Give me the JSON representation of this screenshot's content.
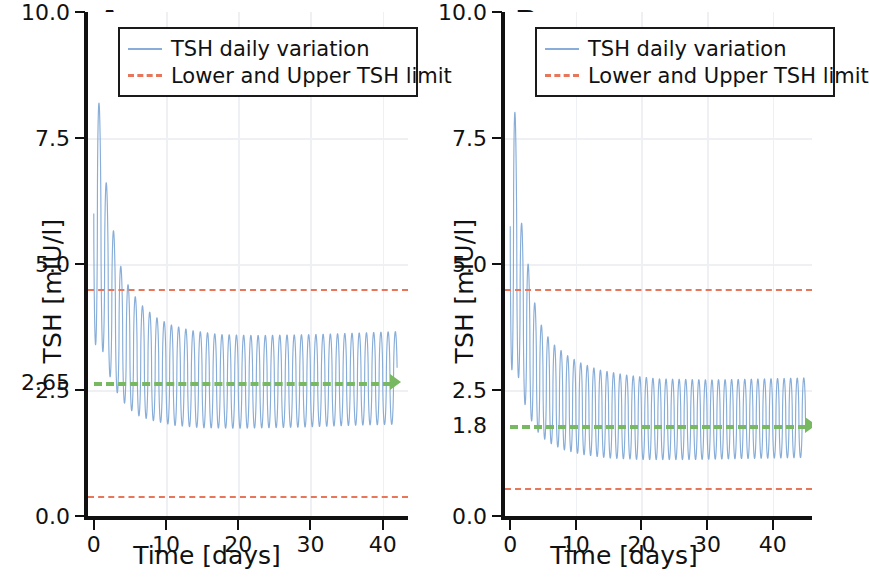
{
  "figure": {
    "panels": [
      {
        "letter": "A",
        "ylabel": "TSH [mIU/l]",
        "xlabel": "Time [days]",
        "yticks": [
          {
            "value": 10.0,
            "label": "10.0"
          },
          {
            "value": 7.5,
            "label": "7.5"
          },
          {
            "value": 5.0,
            "label": "5.0"
          },
          {
            "value": 2.65,
            "label": "2.65"
          },
          {
            "value": 2.5,
            "label": "2.5"
          },
          {
            "value": 0.0,
            "label": "0.0"
          }
        ],
        "xticks": [
          {
            "value": 0,
            "label": "0"
          },
          {
            "value": 10,
            "label": "10"
          },
          {
            "value": 20,
            "label": "20"
          },
          {
            "value": 30,
            "label": "30"
          },
          {
            "value": 40,
            "label": "40"
          }
        ],
        "target_value": 2.65,
        "target_label": "2.65"
      },
      {
        "letter": "B",
        "ylabel": "TSH [mIU/l]",
        "xlabel": "Time [days]",
        "yticks": [
          {
            "value": 10.0,
            "label": "10.0"
          },
          {
            "value": 7.5,
            "label": "7.5"
          },
          {
            "value": 5.0,
            "label": "5.0"
          },
          {
            "value": 2.5,
            "label": "2.5"
          },
          {
            "value": 1.8,
            "label": "1.8"
          },
          {
            "value": 0.0,
            "label": "0.0"
          }
        ],
        "xticks": [
          {
            "value": 0,
            "label": "0"
          },
          {
            "value": 10,
            "label": "10"
          },
          {
            "value": 20,
            "label": "20"
          },
          {
            "value": 30,
            "label": "30"
          },
          {
            "value": 40,
            "label": "40"
          }
        ],
        "target_value": 1.8,
        "target_label": "1.8"
      }
    ],
    "legend": {
      "entries": [
        {
          "label": "TSH daily variation",
          "style": "solid",
          "color": "#87add8"
        },
        {
          "label": "Lower and Upper TSH limit",
          "style": "dashed",
          "color": "#e8765a"
        }
      ]
    },
    "colors": {
      "series": "#87add8",
      "limit": "#e8765a",
      "target": "#77b860",
      "axis": "#111111",
      "grid": "#eef0f4",
      "background": "#ffffff"
    }
  },
  "chart_data": [
    {
      "type": "line",
      "panel": "A",
      "title": "A",
      "xlabel": "Time [days]",
      "ylabel": "TSH [mIU/l]",
      "xlim": [
        -0.8,
        43.5
      ],
      "ylim": [
        0.0,
        10.0
      ],
      "grid": true,
      "legend_position": "upper center",
      "series": [
        {
          "name": "TSH daily variation",
          "style": "solid",
          "color": "#87add8",
          "description": "Damped daily oscillation: first peak 8.6 at day 0.5, decaying envelope settling by ~day 20 into a steady daily cycle oscillating between about 1.75 and 3.6 mIU/l, drawn to day 42.",
          "envelope_peaks": [
            {
              "x": 0.5,
              "y": 8.6
            },
            {
              "x": 1.5,
              "y": 6.85
            },
            {
              "x": 2.5,
              "y": 5.85
            },
            {
              "x": 3.5,
              "y": 5.05
            },
            {
              "x": 4.5,
              "y": 4.65
            },
            {
              "x": 5.5,
              "y": 4.4
            },
            {
              "x": 6.5,
              "y": 4.2
            },
            {
              "x": 8.5,
              "y": 3.95
            },
            {
              "x": 10.5,
              "y": 3.8
            },
            {
              "x": 13.5,
              "y": 3.68
            },
            {
              "x": 17.5,
              "y": 3.6
            },
            {
              "x": 22.5,
              "y": 3.58
            },
            {
              "x": 30.5,
              "y": 3.6
            },
            {
              "x": 38.5,
              "y": 3.64
            },
            {
              "x": 42.0,
              "y": 3.66
            }
          ],
          "envelope_troughs": [
            {
              "x": 1.0,
              "y": 3.4
            },
            {
              "x": 2.0,
              "y": 2.85
            },
            {
              "x": 3.0,
              "y": 2.5
            },
            {
              "x": 4.0,
              "y": 2.28
            },
            {
              "x": 5.0,
              "y": 2.12
            },
            {
              "x": 6.0,
              "y": 2.0
            },
            {
              "x": 8.0,
              "y": 1.9
            },
            {
              "x": 11.0,
              "y": 1.8
            },
            {
              "x": 15.0,
              "y": 1.75
            },
            {
              "x": 20.0,
              "y": 1.74
            },
            {
              "x": 28.0,
              "y": 1.76
            },
            {
              "x": 36.0,
              "y": 1.8
            },
            {
              "x": 42.0,
              "y": 1.82
            }
          ]
        },
        {
          "name": "Upper TSH limit",
          "style": "dashed",
          "color": "#e8765a",
          "value": 4.5
        },
        {
          "name": "Lower TSH limit",
          "style": "dashed",
          "color": "#e8765a",
          "value": 0.4
        },
        {
          "name": "TSH target",
          "style": "dashed-arrow",
          "color": "#77b860",
          "value": 2.65,
          "x_start": 0.0,
          "x_end": 42.0
        }
      ]
    },
    {
      "type": "line",
      "panel": "B",
      "title": "B",
      "xlabel": "Time [days]",
      "ylabel": "TSH [mIU/l]",
      "xlim": [
        -0.8,
        46.0
      ],
      "ylim": [
        0.0,
        10.0
      ],
      "grid": true,
      "legend_position": "upper center",
      "series": [
        {
          "name": "TSH daily variation",
          "style": "solid",
          "color": "#87add8",
          "description": "Damped daily oscillation: first peak 8.6 at day 0.5, decaying envelope settling by ~day 22 into a steady daily cycle oscillating between about 1.1 and 2.7 mIU/l, continuing past the right edge of the axes.",
          "envelope_peaks": [
            {
              "x": 0.5,
              "y": 8.6
            },
            {
              "x": 1.5,
              "y": 6.0
            },
            {
              "x": 2.5,
              "y": 5.2
            },
            {
              "x": 3.5,
              "y": 4.35
            },
            {
              "x": 4.5,
              "y": 3.85
            },
            {
              "x": 5.5,
              "y": 3.6
            },
            {
              "x": 6.5,
              "y": 3.42
            },
            {
              "x": 8.5,
              "y": 3.2
            },
            {
              "x": 10.5,
              "y": 3.05
            },
            {
              "x": 13.5,
              "y": 2.9
            },
            {
              "x": 17.5,
              "y": 2.8
            },
            {
              "x": 22.5,
              "y": 2.72
            },
            {
              "x": 30.5,
              "y": 2.7
            },
            {
              "x": 38.5,
              "y": 2.72
            },
            {
              "x": 45.0,
              "y": 2.74
            }
          ],
          "envelope_troughs": [
            {
              "x": 1.0,
              "y": 2.9
            },
            {
              "x": 2.0,
              "y": 2.3
            },
            {
              "x": 3.0,
              "y": 1.95
            },
            {
              "x": 4.0,
              "y": 1.7
            },
            {
              "x": 5.0,
              "y": 1.55
            },
            {
              "x": 6.0,
              "y": 1.45
            },
            {
              "x": 8.0,
              "y": 1.32
            },
            {
              "x": 11.0,
              "y": 1.22
            },
            {
              "x": 15.0,
              "y": 1.15
            },
            {
              "x": 20.0,
              "y": 1.12
            },
            {
              "x": 28.0,
              "y": 1.12
            },
            {
              "x": 36.0,
              "y": 1.14
            },
            {
              "x": 45.0,
              "y": 1.16
            }
          ]
        },
        {
          "name": "Upper TSH limit",
          "style": "dashed",
          "color": "#e8765a",
          "value": 4.5
        },
        {
          "name": "Lower TSH limit",
          "style": "dashed",
          "color": "#e8765a",
          "value": 0.55
        },
        {
          "name": "TSH target",
          "style": "dashed-arrow",
          "color": "#77b860",
          "value": 1.8,
          "x_start": 0.0,
          "x_end": 46.0
        }
      ]
    }
  ]
}
